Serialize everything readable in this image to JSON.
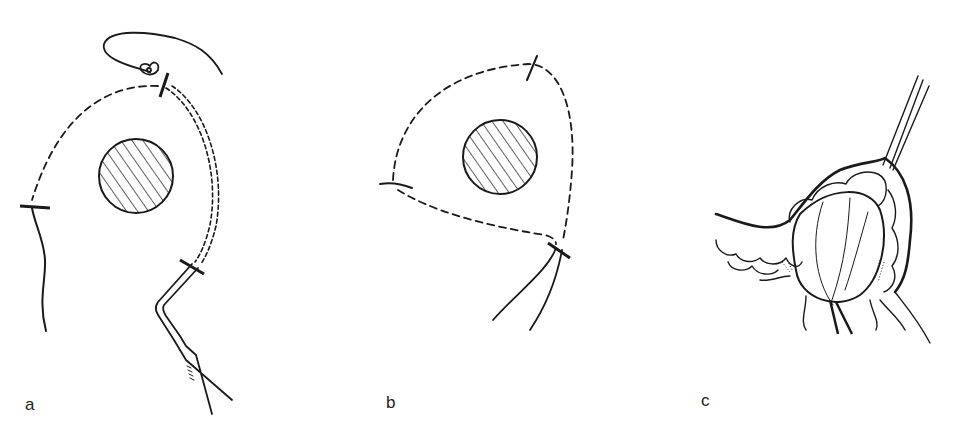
{
  "figure": {
    "panels": [
      {
        "id": "a",
        "label": "a",
        "description": "Dashed incision outline around hatched lesion with skin flap, suture and probe instrument"
      },
      {
        "id": "b",
        "label": "b",
        "description": "Triangular dashed incision outline around hatched lesion with three stitch marks"
      },
      {
        "id": "c",
        "label": "c",
        "description": "Dissected encapsulated mass with surrounding tissue lobules and retraction strings"
      }
    ],
    "colors": {
      "ink": "#1a1a1a",
      "background": "#ffffff"
    }
  }
}
